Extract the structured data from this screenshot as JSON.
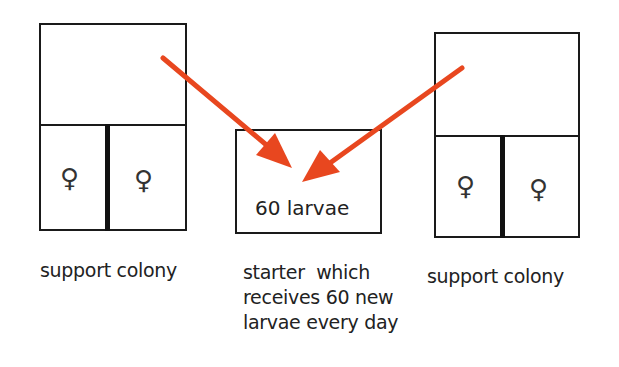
{
  "diagram": {
    "left_colony": {
      "label": "support colony",
      "compartments": [
        {
          "symbol": "♀"
        },
        {
          "symbol": "♀"
        }
      ]
    },
    "starter": {
      "box_text": "60 larvae",
      "caption_lines": [
        "starter  which",
        "receives 60 new",
        "larvae every day"
      ]
    },
    "right_colony": {
      "label": "support colony",
      "compartments": [
        {
          "symbol": "♀"
        },
        {
          "symbol": "♀"
        }
      ]
    },
    "arrow_color": "#e8471f",
    "line_color": "#1a1a1a"
  }
}
